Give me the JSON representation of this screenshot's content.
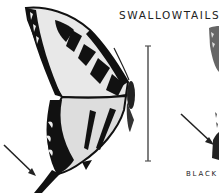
{
  "page": {
    "title": "SWALLOWTAILS",
    "caption": "BLACK",
    "figures": [
      {
        "name": "tiger-swallowtail-illustration",
        "style": "black and white wing pattern"
      },
      {
        "name": "black-swallowtail-illustration",
        "style": "partially visible, cropped at right edge"
      }
    ],
    "scale_bar": {
      "orientation": "vertical"
    },
    "pointer_arrows": 2
  }
}
